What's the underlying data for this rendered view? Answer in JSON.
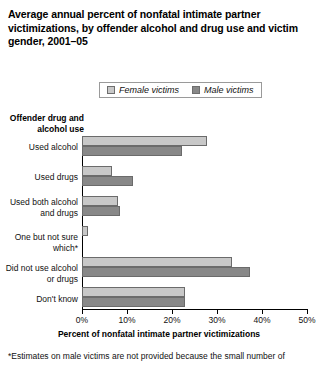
{
  "chart_data": {
    "type": "bar",
    "orientation": "horizontal",
    "title": "Average annual percent of nonfatal intimate partner victimizations, by offender alcohol and drug use and victim gender, 2001–05",
    "xlabel": "Percent of nonfatal intimate partner victimizations",
    "ylabel": "Offender drug and alcohol use",
    "xlim": [
      0,
      50
    ],
    "xticks": [
      0,
      10,
      20,
      30,
      40,
      50
    ],
    "xtick_labels": [
      "0%",
      "10%",
      "20%",
      "30%",
      "40%",
      "50%"
    ],
    "grid": false,
    "legend_position": "top",
    "categories": [
      "Used alcohol",
      "Used drugs",
      "Used both alcohol and drugs",
      "One but not sure which*",
      "Did not use alcohol or drugs",
      "Don't know"
    ],
    "series": [
      {
        "name": "Female victims",
        "color": "#c8c8c8",
        "values": [
          27.8,
          6.7,
          8.0,
          1.3,
          33.3,
          22.9
        ]
      },
      {
        "name": "Male victims",
        "color": "#888888",
        "values": [
          22.2,
          11.3,
          8.4,
          null,
          37.3,
          22.9
        ]
      }
    ],
    "footnote": "*Estimates on male victims are not provided because the small number of"
  },
  "legend": {
    "entries": [
      {
        "label": "Female victims"
      },
      {
        "label": "Male victims"
      }
    ]
  }
}
